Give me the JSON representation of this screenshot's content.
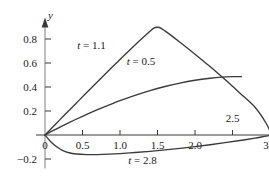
{
  "figure": {
    "background": "#ffffff",
    "ink": "#3a3a3a",
    "text_color": "#1a1a1a"
  },
  "chart_data": {
    "type": "line",
    "title": "",
    "xlabel": "x",
    "ylabel": "y",
    "grid": false,
    "legend": "inline-annotations",
    "xlim": [
      -0.12,
      3.25
    ],
    "ylim": [
      -0.28,
      0.98
    ],
    "xticks": [
      0,
      0.5,
      1.0,
      1.5,
      2.0,
      3.0
    ],
    "xticklabels": [
      "0",
      "0.5",
      "1.0",
      "1.5",
      "2.0",
      "3.0"
    ],
    "yticks": [
      -0.2,
      0.2,
      0.4,
      0.6,
      0.8
    ],
    "yticklabels": [
      "-0.2",
      "0.2",
      "0.4",
      "0.6",
      "0.8"
    ],
    "extra_ticks_unlabeled_x": [
      2.5
    ],
    "annotations": [
      {
        "text": "2.5",
        "x": 2.5,
        "y": 0.105,
        "name": "x-annotation-2-5"
      }
    ],
    "series": [
      {
        "name": "t = 1.1",
        "label": "t = 1.1",
        "label_var": "t",
        "label_value": "1.1",
        "label_x": 0.62,
        "label_y": 0.715,
        "color": "#3a3a3a",
        "points": [
          [
            0.0,
            0.0
          ],
          [
            0.1,
            0.064
          ],
          [
            0.2,
            0.128
          ],
          [
            0.3,
            0.192
          ],
          [
            0.4,
            0.255
          ],
          [
            0.5,
            0.318
          ],
          [
            0.6,
            0.381
          ],
          [
            0.7,
            0.444
          ],
          [
            0.8,
            0.506
          ],
          [
            0.9,
            0.568
          ],
          [
            1.0,
            0.629
          ],
          [
            1.1,
            0.69
          ],
          [
            1.2,
            0.75
          ],
          [
            1.3,
            0.808
          ],
          [
            1.4,
            0.864
          ],
          [
            1.45,
            0.89
          ],
          [
            1.5,
            0.898
          ],
          [
            1.55,
            0.889
          ],
          [
            1.65,
            0.845
          ],
          [
            1.8,
            0.773
          ],
          [
            2.0,
            0.673
          ],
          [
            2.2,
            0.57
          ],
          [
            2.4,
            0.462
          ],
          [
            2.5,
            0.406
          ],
          [
            2.6,
            0.348
          ],
          [
            2.8,
            0.231
          ],
          [
            2.95,
            0.096
          ],
          [
            3.02,
            0.0
          ]
        ]
      },
      {
        "name": "t = 0.5",
        "label": "t = 0.5",
        "label_var": "t",
        "label_value": "0.5",
        "label_x": 1.28,
        "label_y": 0.585,
        "color": "#3a3a3a",
        "points": [
          [
            0.0,
            0.0
          ],
          [
            0.1,
            0.034
          ],
          [
            0.2,
            0.066
          ],
          [
            0.3,
            0.097
          ],
          [
            0.4,
            0.127
          ],
          [
            0.5,
            0.156
          ],
          [
            0.6,
            0.184
          ],
          [
            0.7,
            0.211
          ],
          [
            0.8,
            0.237
          ],
          [
            0.9,
            0.262
          ],
          [
            1.0,
            0.286
          ],
          [
            1.2,
            0.33
          ],
          [
            1.4,
            0.37
          ],
          [
            1.6,
            0.404
          ],
          [
            1.8,
            0.433
          ],
          [
            2.0,
            0.456
          ],
          [
            2.2,
            0.473
          ],
          [
            2.35,
            0.482
          ],
          [
            2.5,
            0.486
          ],
          [
            2.62,
            0.486
          ]
        ]
      },
      {
        "name": "t = 2.8",
        "label": "t = 2.8",
        "label_var": "t",
        "label_value": "2.8",
        "label_x": 1.3,
        "label_y": -0.243,
        "color": "#3a3a3a",
        "points": [
          [
            0.0,
            0.0
          ],
          [
            0.08,
            -0.058
          ],
          [
            0.16,
            -0.1
          ],
          [
            0.24,
            -0.13
          ],
          [
            0.32,
            -0.148
          ],
          [
            0.42,
            -0.158
          ],
          [
            0.55,
            -0.163
          ],
          [
            0.7,
            -0.163
          ],
          [
            0.85,
            -0.16
          ],
          [
            1.0,
            -0.155
          ],
          [
            1.2,
            -0.146
          ],
          [
            1.4,
            -0.136
          ],
          [
            1.6,
            -0.124
          ],
          [
            1.8,
            -0.111
          ],
          [
            2.0,
            -0.097
          ],
          [
            2.2,
            -0.081
          ],
          [
            2.4,
            -0.064
          ],
          [
            2.6,
            -0.046
          ],
          [
            2.8,
            -0.026
          ],
          [
            2.95,
            -0.009
          ],
          [
            3.05,
            0.0
          ]
        ]
      }
    ]
  }
}
